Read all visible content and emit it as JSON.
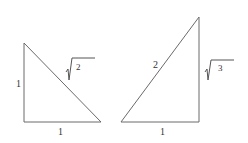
{
  "diagram": {
    "triangles": [
      {
        "name": "45-45-90",
        "vertices": [
          [
            24,
            43
          ],
          [
            24,
            122
          ],
          [
            101,
            122
          ]
        ],
        "labels": {
          "left_leg": "1",
          "bottom_leg": "1",
          "hypotenuse_radicand": "2"
        }
      },
      {
        "name": "30-60-90",
        "vertices": [
          [
            199,
            17
          ],
          [
            121,
            122
          ],
          [
            199,
            122
          ]
        ],
        "labels": {
          "hypotenuse": "2",
          "bottom_leg": "1",
          "right_leg_radicand": "3"
        }
      }
    ],
    "colors": {
      "line": "#6a6a6a",
      "text": "#333333",
      "background": "#ffffff"
    }
  }
}
